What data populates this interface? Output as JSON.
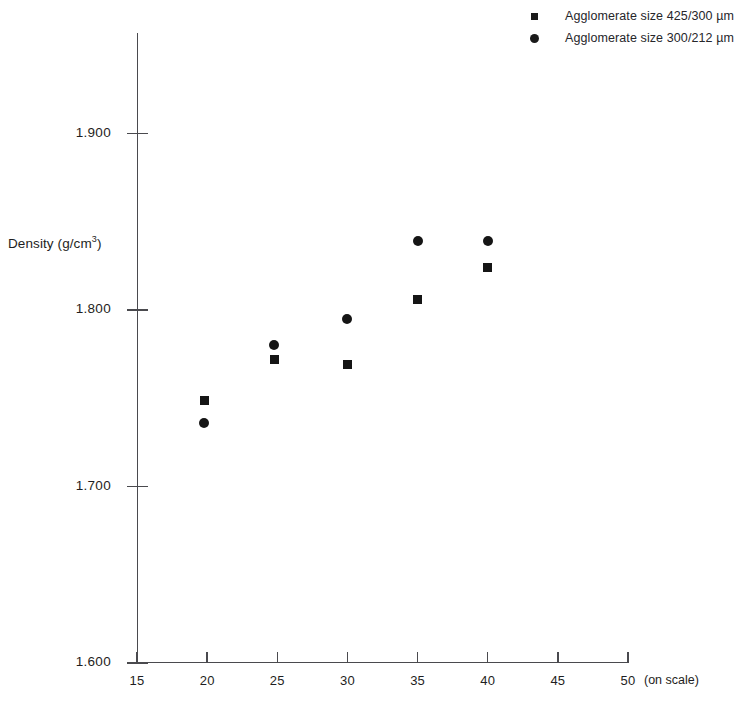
{
  "chart_data": {
    "type": "scatter",
    "title": "",
    "xlabel": "(on scale)",
    "ylabel": "Density (g/cm3)",
    "ylabel_base": "Density (g/cm",
    "ylabel_sup": "3",
    "ylabel_tail": ")",
    "xlim": [
      15,
      50
    ],
    "ylim": [
      1.6,
      1.93
    ],
    "grid": false,
    "legend_position": "top-right",
    "xticks": [
      15,
      20,
      25,
      30,
      35,
      40,
      45,
      50
    ],
    "xtick_labels": [
      "15",
      "20",
      "25",
      "30",
      "35",
      "40",
      "45",
      "50"
    ],
    "yticks": [
      1.6,
      1.7,
      1.8,
      1.9
    ],
    "ytick_labels": [
      "1.600",
      "1.700",
      "1.800",
      "1.900"
    ],
    "series": [
      {
        "name": "Agglomerate size 425/300 µm",
        "marker": "square",
        "color": "#151515",
        "x": [
          19.8,
          24.8,
          30.0,
          35.0,
          40.0
        ],
        "y": [
          1.749,
          1.772,
          1.769,
          1.806,
          1.824
        ]
      },
      {
        "name": "Agglomerate size 300/212 µm",
        "marker": "circle",
        "color": "#151515",
        "x": [
          19.8,
          24.8,
          30.0,
          35.0,
          40.0
        ],
        "y": [
          1.736,
          1.78,
          1.795,
          1.839,
          1.839
        ]
      }
    ]
  },
  "legend": {
    "items": [
      {
        "label": "Agglomerate size 425/300 µm",
        "marker": "square"
      },
      {
        "label": "Agglomerate size 300/212 µm",
        "marker": "circle"
      }
    ]
  },
  "axes": {
    "x_axis_note": "(on scale)",
    "y_axis_title_base": "Density (g/cm",
    "y_axis_title_sup": "3",
    "y_axis_title_tail": ")"
  }
}
